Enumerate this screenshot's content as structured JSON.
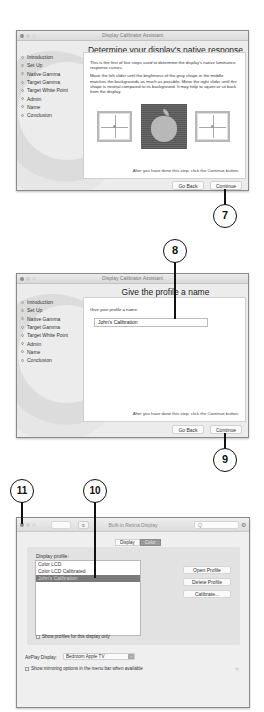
{
  "window1": {
    "title": "Display Calibrator Assistant",
    "heading": "Determine your display's native response",
    "steps": [
      "Introduction",
      "Set Up",
      "Native Gamma",
      "Target Gamma",
      "Target White Point",
      "Admin",
      "Name",
      "Conclusion"
    ],
    "paragraph1": "This is the first of five steps used to determine the display's native luminance response curves.",
    "paragraph2": "Move the left slider until the brightness of the gray shape in the middle matches the backgrounds as much as possible.  Move the right slider until the shape is neutral compared to its background.  It may help to squint or sit back from the display.",
    "footer_text": "After you have done this step, click the Continue button.",
    "go_back_label": "Go Back",
    "continue_label": "Continue",
    "gamma_icons": [
      "left-slider-frame",
      "apple-logo-test-pattern",
      "right-slider-frame"
    ]
  },
  "window2": {
    "title": "Display Calibrator Assistant",
    "heading": "Give the profile a name",
    "steps": [
      "Introduction",
      "Set Up",
      "Native Gamma",
      "Target Gamma",
      "Target White Point",
      "Admin",
      "Name",
      "Conclusion"
    ],
    "prompt": "Give your profile a name:",
    "profile_name_value": "John's Calibration",
    "footer_text": "After you have done this step, click the Continue button.",
    "go_back_label": "Go Back",
    "continue_label": "Continue"
  },
  "window3": {
    "title": "Built-in Retina Display",
    "search_placeholder": "Q",
    "tabs": [
      {
        "label": "Display",
        "active": false
      },
      {
        "label": "Color",
        "active": true
      }
    ],
    "profile_label": "Display profile:",
    "profiles": [
      {
        "label": "Color LCD",
        "selected": false
      },
      {
        "label": "Color LCD Calibrated",
        "selected": false
      },
      {
        "label": "John's Calibration",
        "selected": true
      }
    ],
    "open_profile_label": "Open Profile",
    "delete_profile_label": "Delete Profile",
    "calibrate_label": "Calibrate...",
    "show_profiles_label": "Show profiles for this display only",
    "airplay_label": "AirPlay Display:",
    "airplay_value": "Bedroom Apple TV",
    "mirroring_label": "Show mirroring options in the menu bar when available",
    "help_glyph": "?"
  },
  "callouts": {
    "c7": "7",
    "c8": "8",
    "c9": "9",
    "c10": "10",
    "c11": "11"
  }
}
